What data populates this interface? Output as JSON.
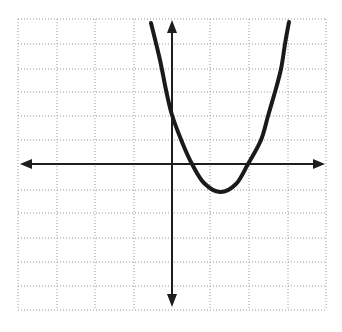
{
  "figure": {
    "colors": {
      "background": "#ffffff",
      "grid": "#9a9a9a",
      "axis": "#1e1e1e",
      "curve": "#1a1a1a"
    }
  },
  "grid": {
    "x_lines_px": [
      18,
      57,
      95,
      134,
      210,
      249,
      288,
      326
    ],
    "y_lines_px": [
      19,
      44,
      69,
      92,
      116,
      140,
      190,
      213,
      238,
      262,
      286,
      310
    ],
    "x_range_px": [
      18,
      326
    ],
    "y_range_px": [
      19,
      310
    ],
    "x_unit_px": 38,
    "y_unit_px": 24,
    "origin_px": [
      172,
      164
    ]
  },
  "axes": {
    "x_axis": {
      "from_px": [
        20,
        164
      ],
      "to_px": [
        325,
        164
      ],
      "arrows": "both"
    },
    "y_axis": {
      "from_px": [
        172,
        20
      ],
      "to_px": [
        172,
        307
      ],
      "arrows": "both"
    }
  },
  "chart_data": {
    "type": "line",
    "title": "",
    "xlabel": "",
    "ylabel": "",
    "grid": true,
    "tick_labels": "none",
    "xlim": [
      -4,
      4
    ],
    "ylim": [
      -6,
      6
    ],
    "series": [
      {
        "name": "parabola",
        "equation": "y = 2x^2 - 5x + 2",
        "x_intercepts": [
          0.5,
          2
        ],
        "y_intercept": 2,
        "vertex": [
          1.25,
          -1.125
        ],
        "x": [
          -0.55,
          0,
          0.5,
          1.25,
          2,
          2.3,
          2.5,
          2.7,
          2.9,
          3.05,
          3.2
        ],
        "y": [
          5.9,
          2,
          0,
          -1.125,
          0,
          1,
          2,
          3,
          4,
          5,
          5.9
        ]
      }
    ],
    "curve_points_px": [
      [
        151,
        23
      ],
      [
        160,
        60
      ],
      [
        166,
        90
      ],
      [
        172,
        115
      ],
      [
        182,
        142
      ],
      [
        192,
        164
      ],
      [
        204,
        183
      ],
      [
        220,
        192
      ],
      [
        236,
        184
      ],
      [
        248,
        164
      ],
      [
        261,
        140
      ],
      [
        268,
        116
      ],
      [
        275,
        92
      ],
      [
        281,
        69
      ],
      [
        285,
        44
      ],
      [
        289,
        22
      ]
    ]
  }
}
